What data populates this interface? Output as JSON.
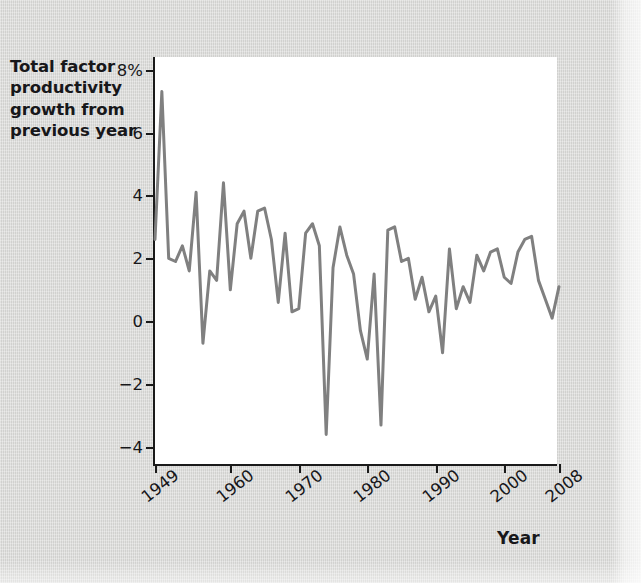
{
  "figure": {
    "background_color": "#d8d8d6",
    "plot_background_color": "#ffffff",
    "axis_color": "#1a1a1a",
    "line_color": "#808080"
  },
  "y_axis": {
    "title_lines": [
      "Total factor",
      "productivity",
      "growth from",
      "previous year"
    ],
    "tick_labels": [
      "8%",
      "6",
      "4",
      "2",
      "0",
      "−2",
      "−4"
    ],
    "tick_values": [
      8,
      6,
      4,
      2,
      0,
      -2,
      -4
    ]
  },
  "x_axis": {
    "title": "Year",
    "tick_labels": [
      "1949",
      "1960",
      "1970",
      "1980",
      "1990",
      "2000",
      "2008"
    ],
    "tick_values": [
      1949,
      1960,
      1970,
      1980,
      1990,
      2000,
      2008
    ]
  },
  "chart_data": {
    "type": "line",
    "title": "",
    "xlabel": "Year",
    "ylabel": "Total factor productivity growth from previous year",
    "xlim": [
      1949,
      2008
    ],
    "ylim": [
      -4.6,
      8.4
    ],
    "grid": false,
    "legend": false,
    "line_color": "#808080",
    "line_width": 3,
    "series": [
      {
        "name": "Total factor productivity growth",
        "x": [
          1949,
          1950,
          1951,
          1952,
          1953,
          1954,
          1955,
          1956,
          1957,
          1958,
          1959,
          1960,
          1961,
          1962,
          1963,
          1964,
          1965,
          1966,
          1967,
          1968,
          1969,
          1970,
          1971,
          1972,
          1973,
          1974,
          1975,
          1976,
          1977,
          1978,
          1979,
          1980,
          1981,
          1982,
          1983,
          1984,
          1985,
          1986,
          1987,
          1988,
          1989,
          1990,
          1991,
          1992,
          1993,
          1994,
          1995,
          1996,
          1997,
          1998,
          1999,
          2000,
          2001,
          2002,
          2003,
          2004,
          2005,
          2006,
          2007,
          2008
        ],
        "values": [
          2.6,
          7.3,
          2.0,
          1.9,
          2.4,
          1.6,
          4.1,
          -0.7,
          1.6,
          1.3,
          4.4,
          1.0,
          3.1,
          3.5,
          2.0,
          3.5,
          3.6,
          2.6,
          0.6,
          2.8,
          0.3,
          0.4,
          2.8,
          3.1,
          2.4,
          -3.6,
          1.7,
          3.0,
          2.1,
          1.5,
          -0.3,
          -1.2,
          1.5,
          -3.3,
          2.9,
          3.0,
          1.9,
          2.0,
          0.7,
          1.4,
          0.3,
          0.8,
          -1.0,
          2.3,
          0.4,
          1.1,
          0.6,
          2.1,
          1.6,
          2.2,
          2.3,
          1.4,
          1.2,
          2.2,
          2.6,
          2.7,
          1.3,
          0.7,
          0.1,
          1.1
        ]
      }
    ]
  }
}
